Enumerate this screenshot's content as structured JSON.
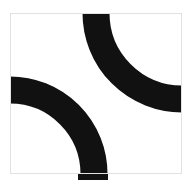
{
  "image": {
    "title": "Quarter-arc tile pattern",
    "width": 193,
    "height": 186,
    "background_color": "#ffffff",
    "alt_text": "Black quarter-arc tile pattern on white square panel"
  },
  "panel": {
    "name": "tile-panel",
    "x": 10,
    "y": 13,
    "width": 172,
    "height": 161,
    "fill_color": "#ffffff",
    "border_color": "#e2e2e2",
    "border_width": 1
  },
  "chart_data": {
    "type": "diagram",
    "title": "Quarter-arc tile pattern",
    "stroke_color": "#111111",
    "stroke_width": 27,
    "shapes": [
      {
        "name": "upper-right-arc",
        "kind": "quarter-arc",
        "center_x": 182,
        "center_y": 13,
        "radius": 86,
        "start_edge": "top",
        "end_edge": "right",
        "entry_span_x": [
          83,
          110
        ],
        "exit_span_y": [
          78,
          105
        ]
      },
      {
        "name": "lower-left-arc",
        "kind": "quarter-arc",
        "center_x": 10,
        "center_y": 174,
        "radius": 84,
        "start_edge": "left",
        "end_edge": "bottom",
        "entry_span_y": [
          81,
          108
        ],
        "exit_span_x": [
          78,
          108
        ]
      }
    ]
  }
}
